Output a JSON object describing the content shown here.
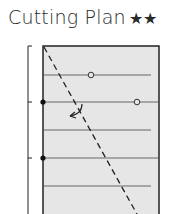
{
  "header": {
    "title": "Cutting Plan",
    "stars": "★★"
  },
  "diagram": {
    "panel_fill": "#e6e6e6",
    "line_color": "#222222",
    "guide_color": "#666666",
    "horizontal_lines": 5,
    "markers": {
      "filled_dots": 2,
      "open_circles": 2,
      "rotation_arrow": 1
    },
    "cut_line": "dashed-diagonal"
  }
}
